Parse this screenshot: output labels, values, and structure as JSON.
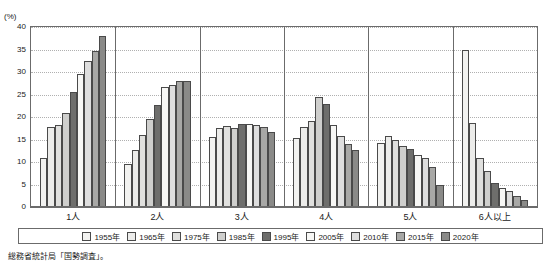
{
  "source_note": "総務省統計局「国勢調査」。",
  "chart_data": {
    "type": "bar",
    "title": "",
    "xlabel": "",
    "ylabel": "(%)",
    "ylim": [
      0,
      40
    ],
    "yticks": [
      0,
      5,
      10,
      15,
      20,
      25,
      30,
      35,
      40
    ],
    "grid": true,
    "legend_position": "bottom",
    "categories": [
      "1人",
      "2人",
      "3人",
      "4人",
      "5人",
      "6人以上"
    ],
    "series": [
      {
        "name": "1955年",
        "color": "#f2f2f0",
        "values": [
          10.8,
          9.5,
          15.6,
          15.3,
          14.3,
          34.8
        ]
      },
      {
        "name": "1965年",
        "color": "#ececea",
        "values": [
          17.8,
          12.6,
          17.5,
          17.8,
          15.8,
          18.7
        ]
      },
      {
        "name": "1975年",
        "color": "#e0e0de",
        "values": [
          18.2,
          16.0,
          17.9,
          19.2,
          14.8,
          11.0
        ]
      },
      {
        "name": "1985年",
        "color": "#cfcfcd",
        "values": [
          20.8,
          19.5,
          17.6,
          24.5,
          13.5,
          8.0
        ]
      },
      {
        "name": "1995年",
        "color": "#6e6e6c",
        "values": [
          25.6,
          22.6,
          18.4,
          23.0,
          12.8,
          5.4
        ]
      },
      {
        "name": "2005年",
        "color": "#f7f7f5",
        "values": [
          29.5,
          26.6,
          18.5,
          18.3,
          11.5,
          4.2
        ]
      },
      {
        "name": "2010年",
        "color": "#dedede",
        "values": [
          32.4,
          27.2,
          18.2,
          15.7,
          10.8,
          3.5
        ]
      },
      {
        "name": "2015年",
        "color": "#a8a8a6",
        "values": [
          34.6,
          27.9,
          17.8,
          14.1,
          8.8,
          2.5
        ]
      },
      {
        "name": "2020年",
        "color": "#8a8a88",
        "values": [
          38.0,
          28.0,
          16.6,
          12.6,
          4.8,
          1.5
        ]
      }
    ]
  }
}
